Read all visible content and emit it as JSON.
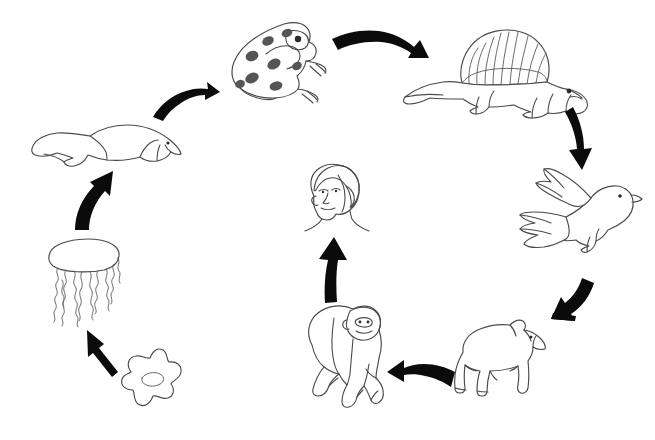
{
  "diagram": {
    "title": "Evolution Cycle",
    "background_color": "#ffffff",
    "ink_color": "#4a4a4a",
    "arrow_color": "#0b0b0b",
    "spot_color": "#555555",
    "style": "hand-drawn line art",
    "layout": "circular clockwise cycle",
    "nodes": [
      {
        "id": "amoeba",
        "label": "amoeba",
        "order": 1,
        "x": 150,
        "y": 382,
        "position": "bottom-left"
      },
      {
        "id": "jellyfish",
        "label": "jellyfish",
        "order": 2,
        "x": 85,
        "y": 282,
        "position": "left-lower"
      },
      {
        "id": "fish",
        "label": "fish",
        "order": 3,
        "x": 105,
        "y": 145,
        "position": "left-upper"
      },
      {
        "id": "frog",
        "label": "frog",
        "order": 4,
        "x": 273,
        "y": 60,
        "position": "top-left"
      },
      {
        "id": "dimetrodon",
        "label": "dimetrodon",
        "order": 5,
        "x": 497,
        "y": 72,
        "position": "top-right"
      },
      {
        "id": "bird",
        "label": "bird",
        "order": 6,
        "x": 582,
        "y": 220,
        "position": "right"
      },
      {
        "id": "bear",
        "label": "bear",
        "order": 7,
        "x": 502,
        "y": 360,
        "position": "bottom-right"
      },
      {
        "id": "ape",
        "label": "ape",
        "order": 8,
        "x": 347,
        "y": 357,
        "position": "bottom-center"
      },
      {
        "id": "human",
        "label": "human",
        "order": 9,
        "x": 337,
        "y": 197,
        "position": "center"
      }
    ],
    "arrows": [
      {
        "id": "amoeba-to-jellyfish",
        "from": "amoeba",
        "to": "jellyfish",
        "direction": "up-left",
        "shape": "straight"
      },
      {
        "id": "jellyfish-to-fish",
        "from": "jellyfish",
        "to": "fish",
        "direction": "up-right",
        "shape": "curved"
      },
      {
        "id": "fish-to-frog",
        "from": "fish",
        "to": "frog",
        "direction": "up-right",
        "shape": "curved"
      },
      {
        "id": "frog-to-dimetrodon",
        "from": "frog",
        "to": "dimetrodon",
        "direction": "right",
        "shape": "curved"
      },
      {
        "id": "dimetrodon-to-bird",
        "from": "dimetrodon",
        "to": "bird",
        "direction": "down",
        "shape": "curved"
      },
      {
        "id": "bird-to-bear",
        "from": "bird",
        "to": "bear",
        "direction": "down-left",
        "shape": "curved"
      },
      {
        "id": "bear-to-ape",
        "from": "bear",
        "to": "ape",
        "direction": "left",
        "shape": "curved"
      },
      {
        "id": "ape-to-human",
        "from": "ape",
        "to": "human",
        "direction": "up",
        "shape": "straight"
      }
    ]
  }
}
